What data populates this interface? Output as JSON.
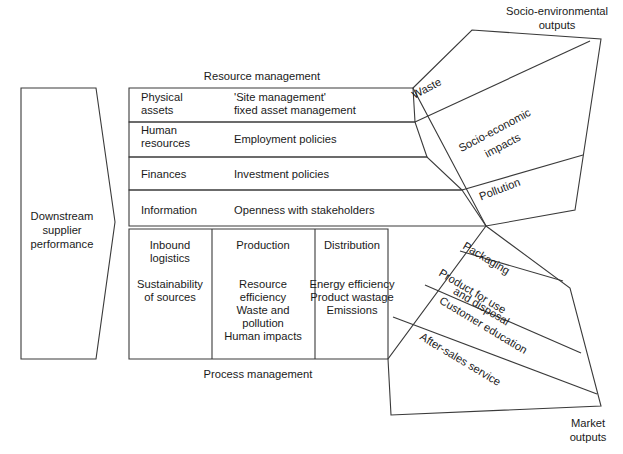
{
  "diagram": {
    "title_left": {
      "line1": "Downstream",
      "line2": "supplier",
      "line3": "performance"
    },
    "section_labels": {
      "resource_management": "Resource management",
      "process_management": "Process management",
      "socio_environmental_outputs_line1": "Socio-environmental",
      "socio_environmental_outputs_line2": "outputs",
      "market_outputs_line1": "Market",
      "market_outputs_line2": "outputs"
    },
    "resource_rows": [
      {
        "category_line1": "Physical",
        "category_line2": "assets",
        "detail_line1": "'Site management'",
        "detail_line2": "fixed asset management"
      },
      {
        "category_line1": "Human",
        "category_line2": "resources",
        "detail_line1": "Employment policies",
        "detail_line2": ""
      },
      {
        "category_line1": "Finances",
        "category_line2": "",
        "detail_line1": "Investment policies",
        "detail_line2": ""
      },
      {
        "category_line1": "Information",
        "category_line2": "",
        "detail_line1": "Openness with stakeholders",
        "detail_line2": ""
      }
    ],
    "process_columns": [
      {
        "heading_line1": "Inbound",
        "heading_line2": "logistics",
        "items": [
          "Sustainability",
          "of sources"
        ]
      },
      {
        "heading_line1": "Production",
        "heading_line2": "",
        "items": [
          "Resource",
          "efficiency",
          "Waste and",
          "pollution",
          "Human impacts"
        ]
      },
      {
        "heading_line1": "Distribution",
        "heading_line2": "",
        "items": [
          "Energy efficiency",
          "Product wastage",
          "Emissions"
        ]
      }
    ],
    "socio_environmental_bands": [
      {
        "label": "Waste"
      },
      {
        "label_line1": "Socio-economic",
        "label_line2": "impacts"
      },
      {
        "label": "Pollution"
      }
    ],
    "market_bands": [
      {
        "label": "Packaging"
      },
      {
        "label_line1": "Product for use",
        "label_line2": "and disposal"
      },
      {
        "label": "Customer education"
      },
      {
        "label": "After-sales service"
      }
    ],
    "colors": {
      "stroke": "#3a3a3a",
      "text": "#1a1a1a",
      "background": "#ffffff"
    }
  }
}
